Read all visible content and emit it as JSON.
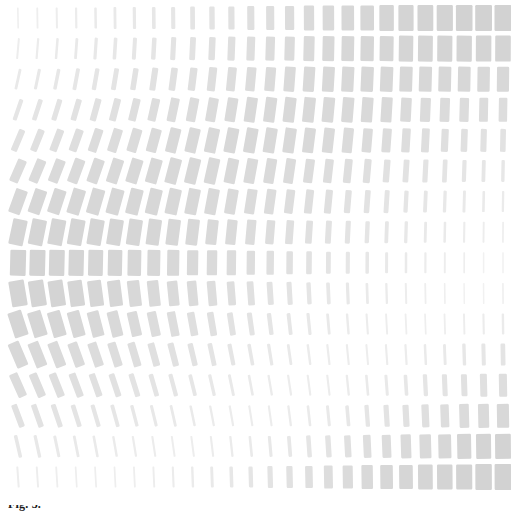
{
  "figure": {
    "caption_fragment": "Fig. 3.",
    "background_color": "#ffffff"
  },
  "chart_data": {
    "type": "heatmap",
    "subtitle": "",
    "xlabel": "",
    "ylabel": "",
    "grid": false,
    "legend": false,
    "n_cols": 26,
    "n_rows": 16,
    "cell_spacing_x": 19.4,
    "cell_spacing_y": 30.6,
    "origin_x": 18,
    "origin_y": 18,
    "element": "rounded-bar",
    "bar_color": "#d2d2d2",
    "bar_color_light": "#f4f4f4",
    "encodings": {
      "width": "bar width in px, range 1.5 to 17",
      "height": "bar height in px, range 20 to 26",
      "rotation": "bar rotation in degrees, range -24 to +24",
      "opacity": "derived from width"
    },
    "axis_notes": {
      "xlim": [
        0,
        25
      ],
      "ylim": [
        0,
        15
      ],
      "x_tick_labels": [],
      "y_tick_labels": []
    },
    "widths": [
      [
        1.6,
        1.8,
        2.0,
        2.2,
        2.5,
        2.8,
        3.2,
        3.6,
        4.1,
        4.7,
        5.4,
        6.2,
        7.1,
        8.1,
        9.2,
        10.3,
        11.5,
        12.6,
        13.6,
        14.5,
        15.2,
        15.8,
        16.2,
        16.6,
        16.8,
        17.0
      ],
      [
        2.0,
        2.2,
        2.5,
        2.8,
        3.2,
        3.6,
        4.0,
        4.5,
        5.1,
        5.8,
        6.5,
        7.3,
        8.2,
        9.1,
        10.0,
        10.9,
        11.8,
        12.6,
        13.3,
        13.9,
        14.4,
        14.8,
        15.1,
        15.3,
        15.5,
        15.6
      ],
      [
        2.8,
        3.1,
        3.5,
        3.9,
        4.4,
        4.9,
        5.5,
        6.1,
        6.7,
        7.4,
        8.1,
        8.8,
        9.5,
        10.2,
        10.8,
        11.3,
        11.8,
        12.2,
        12.5,
        12.7,
        12.8,
        12.8,
        12.7,
        12.6,
        12.4,
        12.2
      ],
      [
        4.2,
        4.7,
        5.2,
        5.8,
        6.4,
        7.0,
        7.7,
        8.3,
        8.9,
        9.5,
        10.1,
        10.6,
        11.0,
        11.3,
        11.5,
        11.6,
        11.6,
        11.5,
        11.3,
        11.0,
        10.6,
        10.2,
        9.8,
        9.3,
        8.9,
        8.5
      ],
      [
        6.4,
        7.0,
        7.6,
        8.2,
        8.9,
        9.5,
        10.0,
        10.5,
        11.0,
        11.3,
        11.6,
        11.7,
        11.7,
        11.6,
        11.4,
        11.1,
        10.7,
        10.2,
        9.6,
        9.0,
        8.4,
        7.8,
        7.2,
        6.6,
        6.1,
        5.6
      ],
      [
        9.2,
        9.8,
        10.3,
        10.8,
        11.2,
        11.5,
        11.8,
        11.9,
        11.9,
        11.8,
        11.6,
        11.3,
        10.9,
        10.4,
        9.8,
        9.2,
        8.5,
        7.8,
        7.1,
        6.4,
        5.8,
        5.2,
        4.7,
        4.2,
        3.8,
        3.4
      ],
      [
        12.2,
        12.5,
        12.7,
        12.9,
        13.0,
        13.0,
        12.9,
        12.7,
        12.4,
        12.0,
        11.5,
        10.9,
        10.2,
        9.5,
        8.7,
        7.9,
        7.1,
        6.3,
        5.6,
        4.9,
        4.3,
        3.8,
        3.3,
        2.9,
        2.6,
        2.3
      ],
      [
        14.6,
        14.7,
        14.7,
        14.6,
        14.4,
        14.1,
        13.7,
        13.2,
        12.6,
        11.9,
        11.1,
        10.3,
        9.4,
        8.5,
        7.6,
        6.7,
        5.9,
        5.1,
        4.4,
        3.8,
        3.3,
        2.8,
        2.5,
        2.1,
        1.9,
        1.7
      ],
      [
        15.8,
        15.7,
        15.5,
        15.2,
        14.8,
        14.3,
        13.6,
        12.9,
        12.1,
        11.2,
        10.3,
        9.3,
        8.3,
        7.4,
        6.5,
        5.6,
        4.8,
        4.1,
        3.5,
        3.0,
        2.5,
        2.2,
        1.9,
        1.7,
        1.5,
        1.5
      ],
      [
        15.6,
        15.4,
        15.0,
        14.5,
        13.9,
        13.2,
        12.4,
        11.5,
        10.6,
        9.6,
        8.7,
        7.7,
        6.8,
        5.9,
        5.1,
        4.4,
        3.7,
        3.2,
        2.7,
        2.3,
        2.0,
        1.8,
        1.6,
        1.5,
        1.5,
        1.6
      ],
      [
        14.2,
        13.8,
        13.3,
        12.7,
        12.0,
        11.2,
        10.3,
        9.4,
        8.5,
        7.6,
        6.7,
        5.9,
        5.1,
        4.4,
        3.8,
        3.2,
        2.8,
        2.4,
        2.1,
        1.9,
        1.8,
        1.7,
        1.8,
        1.9,
        2.1,
        2.4
      ],
      [
        11.8,
        11.3,
        10.7,
        10.1,
        9.4,
        8.6,
        7.8,
        7.0,
        6.3,
        5.5,
        4.8,
        4.2,
        3.6,
        3.2,
        2.8,
        2.4,
        2.2,
        2.1,
        2.0,
        2.1,
        2.2,
        2.5,
        2.9,
        3.4,
        4.0,
        4.7
      ],
      [
        8.9,
        8.4,
        7.8,
        7.2,
        6.6,
        6.0,
        5.4,
        4.8,
        4.3,
        3.8,
        3.3,
        2.9,
        2.6,
        2.3,
        2.2,
        2.1,
        2.1,
        2.3,
        2.6,
        3.0,
        3.6,
        4.3,
        5.1,
        6.0,
        7.0,
        8.1
      ],
      [
        6.0,
        5.6,
        5.1,
        4.7,
        4.2,
        3.8,
        3.4,
        3.1,
        2.8,
        2.5,
        2.3,
        2.2,
        2.1,
        2.1,
        2.3,
        2.6,
        3.0,
        3.6,
        4.3,
        5.2,
        6.2,
        7.3,
        8.5,
        9.7,
        10.9,
        12.1
      ],
      [
        3.6,
        3.3,
        3.0,
        2.8,
        2.6,
        2.4,
        2.2,
        2.1,
        2.0,
        2.0,
        2.1,
        2.3,
        2.6,
        3.1,
        3.7,
        4.5,
        5.4,
        6.5,
        7.7,
        9.0,
        10.3,
        11.6,
        12.9,
        14.0,
        15.0,
        15.8
      ],
      [
        2.0,
        1.9,
        1.8,
        1.7,
        1.7,
        1.7,
        1.8,
        1.9,
        2.1,
        2.4,
        2.9,
        3.5,
        4.3,
        5.2,
        6.3,
        7.5,
        8.8,
        10.1,
        11.4,
        12.6,
        13.7,
        14.7,
        15.5,
        16.1,
        16.5,
        16.8
      ]
    ],
    "rotations": [
      [
        -1.0,
        -0.9,
        -0.9,
        -0.8,
        -0.8,
        -0.7,
        -0.7,
        -0.6,
        -0.6,
        -0.5,
        -0.5,
        -0.4,
        -0.4,
        -0.3,
        -0.3,
        -0.3,
        -0.2,
        -0.2,
        -0.2,
        -0.1,
        -0.1,
        -0.1,
        -0.1,
        0.0,
        0.0,
        0.0
      ],
      [
        5.0,
        4.7,
        4.5,
        4.2,
        3.9,
        3.7,
        3.4,
        3.2,
        2.9,
        2.7,
        2.4,
        2.2,
        2.0,
        1.8,
        1.6,
        1.4,
        1.2,
        1.1,
        0.9,
        0.8,
        0.7,
        0.5,
        0.4,
        0.3,
        0.2,
        0.2
      ],
      [
        12.5,
        11.9,
        11.3,
        10.6,
        10.0,
        9.4,
        8.8,
        8.2,
        7.6,
        7.0,
        6.4,
        5.8,
        5.3,
        4.8,
        4.3,
        3.8,
        3.4,
        2.9,
        2.5,
        2.2,
        1.8,
        1.5,
        1.2,
        1.0,
        0.8,
        0.6
      ],
      [
        19.0,
        18.1,
        17.2,
        16.3,
        15.4,
        14.5,
        13.6,
        12.7,
        11.8,
        10.9,
        10.0,
        9.2,
        8.4,
        7.6,
        6.8,
        6.1,
        5.4,
        4.7,
        4.1,
        3.5,
        2.9,
        2.4,
        2.0,
        1.6,
        1.2,
        0.9
      ],
      [
        22.8,
        21.8,
        20.8,
        19.7,
        18.6,
        17.5,
        16.4,
        15.3,
        14.2,
        13.2,
        12.1,
        11.1,
        10.1,
        9.2,
        8.2,
        7.3,
        6.5,
        5.7,
        4.9,
        4.2,
        3.5,
        2.9,
        2.4,
        1.9,
        1.5,
        1.1
      ],
      [
        23.5,
        22.4,
        21.3,
        20.2,
        19.1,
        18.0,
        16.9,
        15.8,
        14.7,
        13.6,
        12.5,
        11.4,
        10.4,
        9.4,
        8.4,
        7.5,
        6.6,
        5.8,
        5.0,
        4.3,
        3.6,
        3.0,
        2.4,
        1.9,
        1.5,
        1.1
      ],
      [
        20.0,
        19.1,
        18.2,
        17.2,
        16.2,
        15.3,
        14.3,
        13.4,
        12.4,
        11.5,
        10.6,
        9.7,
        8.8,
        8.0,
        7.1,
        6.3,
        5.6,
        4.9,
        4.2,
        3.6,
        3.0,
        2.5,
        2.0,
        1.6,
        1.2,
        0.9
      ],
      [
        12.0,
        11.4,
        10.8,
        10.3,
        9.7,
        9.1,
        8.5,
        8.0,
        7.4,
        6.8,
        6.3,
        5.8,
        5.2,
        4.7,
        4.2,
        3.8,
        3.3,
        2.9,
        2.5,
        2.1,
        1.8,
        1.5,
        1.2,
        0.9,
        0.7,
        0.5
      ],
      [
        1.5,
        1.4,
        1.3,
        1.3,
        1.2,
        1.1,
        1.0,
        1.0,
        0.9,
        0.8,
        0.8,
        0.7,
        0.6,
        0.6,
        0.5,
        0.5,
        0.4,
        0.3,
        0.3,
        0.2,
        0.2,
        0.2,
        0.1,
        0.1,
        0.1,
        0.0
      ],
      [
        -9.5,
        -9.0,
        -8.6,
        -8.1,
        -7.7,
        -7.2,
        -6.8,
        -6.3,
        -5.9,
        -5.4,
        -5.0,
        -4.6,
        -4.2,
        -3.8,
        -3.4,
        -3.0,
        -2.6,
        -2.3,
        -2.0,
        -1.7,
        -1.4,
        -1.2,
        -0.9,
        -0.7,
        -0.5,
        -0.4
      ],
      [
        -18.0,
        -17.2,
        -16.3,
        -15.5,
        -14.6,
        -13.8,
        -12.9,
        -12.1,
        -11.2,
        -10.4,
        -9.6,
        -8.8,
        -8.0,
        -7.2,
        -6.5,
        -5.8,
        -5.1,
        -4.4,
        -3.8,
        -3.2,
        -2.7,
        -2.2,
        -1.8,
        -1.4,
        -1.1,
        -0.8
      ],
      [
        -23.0,
        -21.9,
        -20.9,
        -19.8,
        -18.7,
        -17.6,
        -16.5,
        -15.4,
        -14.4,
        -13.3,
        -12.2,
        -11.2,
        -10.2,
        -9.2,
        -8.2,
        -7.3,
        -6.4,
        -5.6,
        -4.8,
        -4.1,
        -3.4,
        -2.8,
        -2.3,
        -1.8,
        -1.4,
        -1.0
      ],
      [
        -24.0,
        -22.9,
        -21.8,
        -20.7,
        -19.5,
        -18.4,
        -17.3,
        -16.1,
        -15.0,
        -13.9,
        -12.8,
        -11.7,
        -10.6,
        -9.6,
        -8.6,
        -7.6,
        -6.7,
        -5.8,
        -5.0,
        -4.3,
        -3.6,
        -3.0,
        -2.4,
        -1.9,
        -1.5,
        -1.1
      ],
      [
        -20.5,
        -19.5,
        -18.6,
        -17.6,
        -16.6,
        -15.6,
        -14.7,
        -13.7,
        -12.7,
        -11.8,
        -10.8,
        -9.9,
        -9.0,
        -8.1,
        -7.3,
        -6.4,
        -5.7,
        -4.9,
        -4.2,
        -3.6,
        -3.0,
        -2.5,
        -2.0,
        -1.6,
        -1.2,
        -0.9
      ],
      [
        -13.0,
        -12.4,
        -11.8,
        -11.2,
        -10.5,
        -9.9,
        -9.3,
        -8.7,
        -8.1,
        -7.5,
        -6.9,
        -6.3,
        -5.7,
        -5.2,
        -4.6,
        -4.1,
        -3.6,
        -3.1,
        -2.7,
        -2.3,
        -1.9,
        -1.5,
        -1.2,
        -1.0,
        -0.7,
        -0.5
      ],
      [
        -4.0,
        -3.8,
        -3.6,
        -3.4,
        -3.2,
        -3.0,
        -2.8,
        -2.6,
        -2.4,
        -2.2,
        -2.1,
        -1.9,
        -1.7,
        -1.6,
        -1.4,
        -1.2,
        -1.1,
        -0.9,
        -0.8,
        -0.7,
        -0.6,
        -0.5,
        -0.4,
        -0.3,
        -0.2,
        -0.2
      ]
    ],
    "heights": [
      [
        21,
        21,
        21,
        21,
        21,
        22,
        22,
        22,
        22,
        23,
        23,
        23,
        24,
        24,
        24,
        25,
        25,
        25,
        25,
        26,
        26,
        26,
        26,
        26,
        26,
        26
      ],
      [
        21,
        21,
        21,
        21,
        22,
        22,
        22,
        22,
        23,
        23,
        23,
        24,
        24,
        24,
        24,
        25,
        25,
        25,
        25,
        25,
        26,
        26,
        26,
        26,
        26,
        26
      ],
      [
        21,
        21,
        21,
        22,
        22,
        22,
        22,
        23,
        23,
        23,
        24,
        24,
        24,
        24,
        25,
        25,
        25,
        25,
        25,
        25,
        25,
        25,
        25,
        25,
        25,
        25
      ],
      [
        22,
        22,
        22,
        22,
        23,
        23,
        23,
        23,
        24,
        24,
        24,
        24,
        25,
        25,
        25,
        25,
        25,
        25,
        25,
        25,
        24,
        24,
        24,
        24,
        24,
        24
      ],
      [
        23,
        23,
        23,
        23,
        24,
        24,
        24,
        24,
        25,
        25,
        25,
        25,
        25,
        25,
        25,
        25,
        25,
        25,
        24,
        24,
        24,
        24,
        23,
        23,
        23,
        23
      ],
      [
        24,
        24,
        24,
        25,
        25,
        25,
        25,
        25,
        26,
        26,
        26,
        25,
        25,
        25,
        25,
        24,
        24,
        24,
        24,
        23,
        23,
        23,
        23,
        22,
        22,
        22
      ],
      [
        25,
        25,
        25,
        26,
        26,
        26,
        26,
        26,
        26,
        26,
        26,
        25,
        25,
        25,
        24,
        24,
        24,
        23,
        23,
        23,
        22,
        22,
        22,
        22,
        21,
        21
      ],
      [
        26,
        26,
        26,
        26,
        26,
        26,
        26,
        26,
        26,
        26,
        25,
        25,
        25,
        24,
        24,
        23,
        23,
        23,
        22,
        22,
        22,
        21,
        21,
        21,
        21,
        21
      ],
      [
        26,
        26,
        26,
        26,
        26,
        26,
        26,
        26,
        26,
        25,
        25,
        25,
        24,
        24,
        23,
        23,
        22,
        22,
        22,
        21,
        21,
        21,
        21,
        21,
        21,
        21
      ],
      [
        26,
        26,
        26,
        26,
        26,
        26,
        26,
        26,
        25,
        25,
        25,
        24,
        24,
        23,
        23,
        22,
        22,
        22,
        21,
        21,
        21,
        21,
        21,
        21,
        21,
        21
      ],
      [
        26,
        26,
        26,
        26,
        26,
        26,
        25,
        25,
        25,
        24,
        24,
        23,
        23,
        22,
        22,
        22,
        21,
        21,
        21,
        21,
        21,
        21,
        21,
        21,
        21,
        21
      ],
      [
        26,
        26,
        26,
        25,
        25,
        25,
        25,
        24,
        24,
        23,
        23,
        22,
        22,
        22,
        21,
        21,
        21,
        21,
        21,
        21,
        21,
        21,
        21,
        22,
        22,
        22
      ],
      [
        25,
        25,
        25,
        25,
        24,
        24,
        24,
        23,
        23,
        22,
        22,
        22,
        21,
        21,
        21,
        21,
        21,
        21,
        21,
        21,
        21,
        22,
        22,
        22,
        23,
        23
      ],
      [
        24,
        24,
        24,
        23,
        23,
        23,
        22,
        22,
        22,
        21,
        21,
        21,
        21,
        21,
        21,
        21,
        21,
        21,
        22,
        22,
        22,
        23,
        23,
        24,
        24,
        24
      ],
      [
        23,
        23,
        22,
        22,
        22,
        21,
        21,
        21,
        21,
        21,
        21,
        21,
        21,
        21,
        21,
        22,
        22,
        22,
        23,
        23,
        24,
        24,
        24,
        25,
        25,
        25
      ],
      [
        21,
        21,
        21,
        21,
        21,
        21,
        21,
        21,
        21,
        21,
        21,
        21,
        21,
        22,
        22,
        22,
        23,
        23,
        24,
        24,
        24,
        25,
        25,
        25,
        26,
        26
      ]
    ]
  }
}
